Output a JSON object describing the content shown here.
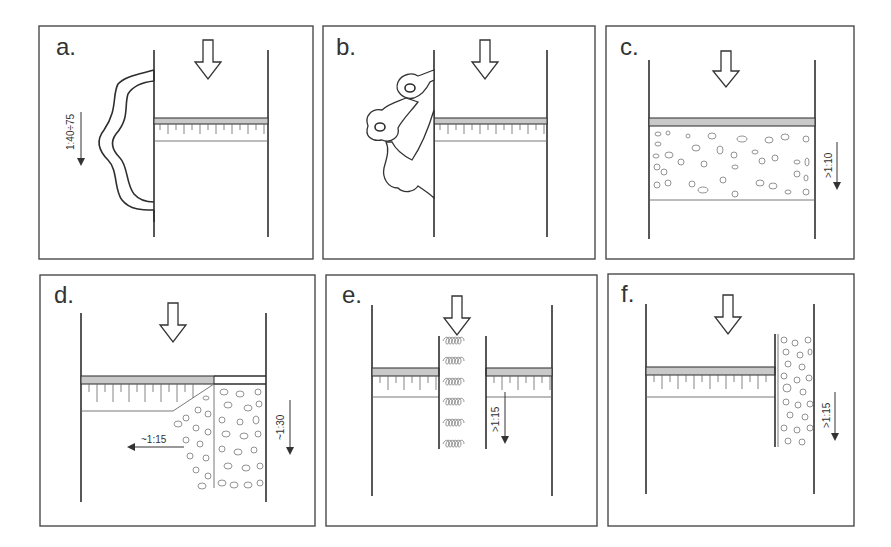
{
  "figure": {
    "panels": [
      {
        "id": "a",
        "label": "a.",
        "ratio_label": "1:40÷75",
        "ratio_direction": "down",
        "feature": "wavy layered wall bulge on left"
      },
      {
        "id": "b",
        "label": "b.",
        "ratio_label": "",
        "feature": "lobed wall bulge with cavities on left"
      },
      {
        "id": "c",
        "label": "c.",
        "ratio_label": ">1:10",
        "ratio_direction": "down",
        "feature": "full-width infill block beneath slab"
      },
      {
        "id": "d",
        "label": "d.",
        "ratio_labels": [
          "~1:15",
          "~1:30"
        ],
        "ratio_directions": [
          "left",
          "down"
        ],
        "feature": "sloped fill wedge and vertical fill column on right"
      },
      {
        "id": "e",
        "label": "e.",
        "ratio_label": ">1:15",
        "ratio_direction": "down",
        "feature": "central coiled column through slab"
      },
      {
        "id": "f",
        "label": "f.",
        "ratio_label": ">1:15",
        "ratio_direction": "down",
        "feature": "narrow infill column at right wall"
      }
    ]
  },
  "colors": {
    "line": "#2e2e2e",
    "slab_fill": "#c9c9c9",
    "background": "#ffffff"
  }
}
